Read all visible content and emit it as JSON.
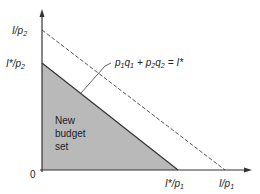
{
  "diagram": {
    "type": "budget-constraint",
    "axes": {
      "origin_label": "0",
      "y_ticks": [
        {
          "id": "y_high",
          "text": "I/p",
          "sub": "2"
        },
        {
          "id": "y_low",
          "text": "I*/p",
          "sub": "2"
        }
      ],
      "x_ticks": [
        {
          "id": "x_low",
          "text": "I*/p",
          "sub": "1"
        },
        {
          "id": "x_high",
          "text": "I/p",
          "sub": "1"
        }
      ]
    },
    "equation": {
      "p1": "p",
      "p1_sub": "1",
      "q1": "q",
      "q1_sub": "1",
      "plus": "+",
      "p2": "p",
      "p2_sub": "2",
      "q2": "q",
      "q2_sub": "2",
      "eq": "=",
      "rhs": "I*"
    },
    "region_label": [
      "New",
      "budget",
      "set"
    ],
    "colors": {
      "shade": "#b9b9b9",
      "line": "#333333",
      "dashed": "#555555"
    }
  }
}
